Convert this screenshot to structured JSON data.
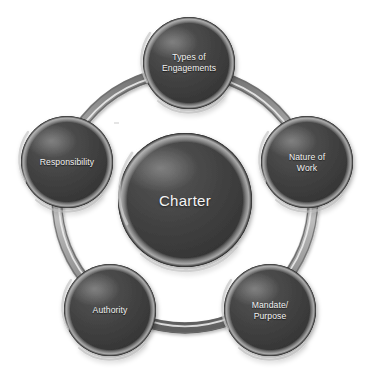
{
  "diagram": {
    "type": "hub-and-spoke-ring",
    "center": {
      "label": "Charter"
    },
    "ring": {
      "name": "connector-ring",
      "color": "#9a9a9a",
      "highlight_color": "#e8e8e8"
    },
    "node_style": {
      "fill": "#3f3f3f",
      "fill_dark": "#2a2a2a",
      "rim_highlight": "#b9b9b9",
      "text_color": "#f2f2f2"
    },
    "nodes": [
      {
        "id": "types-of-engagements",
        "label": "Types of\nEngagements"
      },
      {
        "id": "nature-of-work",
        "label": "Nature of\nWork"
      },
      {
        "id": "mandate-purpose",
        "label": "Mandate/\nPurpose"
      },
      {
        "id": "authority",
        "label": "Authority"
      },
      {
        "id": "responsibility",
        "label": "Responsibility"
      }
    ]
  }
}
